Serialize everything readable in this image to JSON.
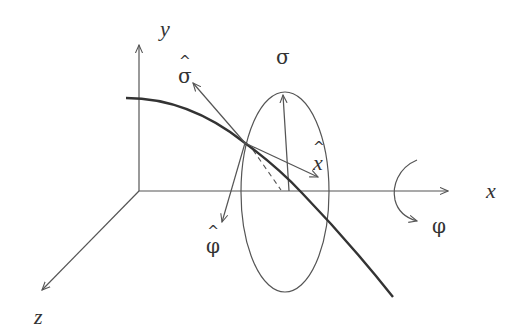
{
  "diagram": {
    "type": "3d-coordinate-diagram",
    "colors": {
      "axis": "#555555",
      "curve": "#333333",
      "text": "#333333"
    },
    "axes": {
      "x": {
        "label": "x"
      },
      "y": {
        "label": "y"
      },
      "z": {
        "label": "z"
      }
    },
    "labels": {
      "sigma_plane": "σ",
      "sigma_hat": "σ",
      "x_hat": "x",
      "phi_hat": "φ",
      "phi_rotation": "φ",
      "hat_symbol": "^"
    }
  }
}
